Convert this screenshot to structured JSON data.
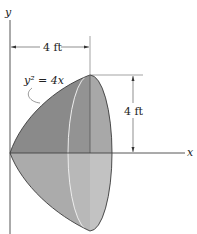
{
  "figure": {
    "type": "paraboloid-of-revolution",
    "curve_equation": "y² = 4x",
    "axes": {
      "x_label": "x",
      "y_label": "y"
    },
    "dimensions": {
      "horizontal": "4 ft",
      "vertical": "4 ft"
    },
    "colors": {
      "upper_surface": "#8a8a8a",
      "lower_surface": "#ababab",
      "end_face_upper": "#a8a8a8",
      "end_face_lower": "#c0c0c0",
      "outline": "#333333",
      "highlight": "#e8e8e8"
    }
  }
}
